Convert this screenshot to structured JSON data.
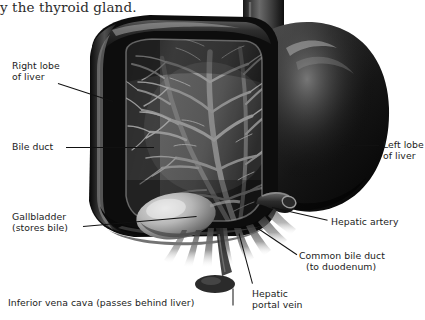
{
  "page": {
    "width": 425,
    "height": 320,
    "background": "#ffffff",
    "figure_type": "anatomical-illustration"
  },
  "running_text": {
    "line": "y the thyroid gland."
  },
  "labels": [
    {
      "id": "right-lobe",
      "lines": [
        "Right lobe",
        "of liver"
      ],
      "text": "Right lobe of liver",
      "x": 12,
      "y": 60,
      "align": "left"
    },
    {
      "id": "bile-duct",
      "lines": [
        "Bile duct"
      ],
      "text": "Bile duct",
      "x": 12,
      "y": 141,
      "align": "left"
    },
    {
      "id": "gallbladder",
      "lines": [
        "Gallbladder",
        "(stores bile)"
      ],
      "text": "Gallbladder (stores bile)",
      "x": 12,
      "y": 211,
      "align": "left"
    },
    {
      "id": "inferior-vena-cava",
      "lines": [
        "Inferior vena cava (passes behind liver)"
      ],
      "text": "Inferior vena cava (passes behind liver)",
      "x": 8,
      "y": 297,
      "align": "left"
    },
    {
      "id": "left-lobe",
      "lines": [
        "Left lobe",
        "of liver"
      ],
      "text": "Left lobe of liver",
      "x": 383,
      "y": 139,
      "align": "left"
    },
    {
      "id": "hepatic-artery",
      "lines": [
        "Hepatic artery"
      ],
      "text": "Hepatic artery",
      "x": 331,
      "y": 216,
      "align": "left"
    },
    {
      "id": "common-bile-duct",
      "lines": [
        "Common bile duct",
        "(to duodenum)"
      ],
      "text": "Common bile duct (to duodenum)",
      "x": 299,
      "y": 250,
      "align": "left"
    },
    {
      "id": "hepatic-portal-vein",
      "lines": [
        "Hepatic",
        "portal vein"
      ],
      "text": "Hepatic portal vein",
      "x": 252,
      "y": 288,
      "align": "left"
    }
  ],
  "leaders": [
    {
      "id": "leader-right-lobe",
      "x1": 58,
      "y1": 83,
      "x2": 113,
      "y2": 101
    },
    {
      "id": "leader-bile-duct",
      "x1": 66,
      "y1": 147,
      "x2": 152,
      "y2": 147
    },
    {
      "id": "leader-gallbladder",
      "x1": 83,
      "y1": 225,
      "x2": 196,
      "y2": 215
    },
    {
      "id": "leader-inferior-vena-cava",
      "x1": 233,
      "y1": 288,
      "x2": 233,
      "y2": 305
    },
    {
      "id": "leader-left-lobe",
      "x1": 340,
      "y1": 145,
      "x2": 379,
      "y2": 145
    },
    {
      "id": "leader-hepatic-artery",
      "x1": 272,
      "y1": 207,
      "x2": 328,
      "y2": 220
    },
    {
      "id": "leader-common-bile-duct",
      "x1": 258,
      "y1": 228,
      "x2": 296,
      "y2": 254
    },
    {
      "id": "leader-hepatic-portal-vein",
      "x1": 239,
      "y1": 233,
      "x2": 252,
      "y2": 283
    }
  ],
  "colors": {
    "ink": "#1b1b1b",
    "leader": "#111111",
    "liver_dark": "#131313",
    "liver_mid": "#4a4a4a",
    "liver_light": "#8e8e8e",
    "vessel": "#6f6f6f",
    "gallbladder": "#c9c9c9",
    "background": "#ffffff"
  },
  "structures": [
    {
      "name": "right-lobe-of-liver",
      "description": "large cut-open right lobe showing internal vessel tree"
    },
    {
      "name": "left-lobe-of-liver",
      "description": "smooth dark rounded lobe on the right side of image"
    },
    {
      "name": "gallbladder",
      "description": "pale oval sac on the inferior surface of the right lobe"
    },
    {
      "name": "bile-duct-network",
      "description": "branching intrahepatic duct and vessel tree"
    },
    {
      "name": "hepatic-artery",
      "description": "tubular vessel protruding at lower right of right lobe"
    },
    {
      "name": "common-bile-duct",
      "description": "duct descending from the porta hepatis toward the duodenum"
    },
    {
      "name": "hepatic-portal-vein",
      "description": "vein descending from the inferior border of the liver"
    },
    {
      "name": "inferior-vena-cava",
      "description": "large vein passing behind the liver, emerging at the top notch"
    }
  ]
}
